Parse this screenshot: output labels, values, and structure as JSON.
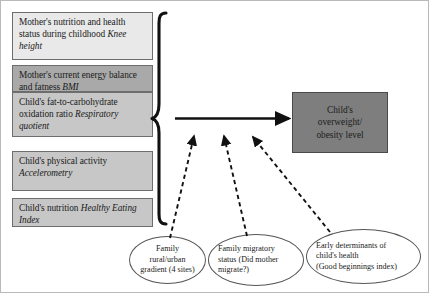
{
  "diagram": {
    "predictor_boxes": [
      {
        "id": "mother-nutrition",
        "text_plain": "Mother's nutrition and health status during childhood ",
        "measure_italic": "Knee height",
        "fill": "#e9e9e9"
      },
      {
        "id": "mother-energy",
        "text_plain": "Mother's current energy balance and fatness ",
        "measure_italic": "BMI",
        "fill": "#a9a9a9"
      },
      {
        "id": "child-fat-carb",
        "text_plain": "Child's fat-to-carbohydrate oxidation ratio ",
        "measure_italic": "Respiratory quotient",
        "fill": "#c7c7c7"
      },
      {
        "id": "child-activity",
        "text_plain": "Child's physical activity ",
        "measure_italic": "Accelerometry",
        "fill": "#c7c7c7"
      },
      {
        "id": "child-nutrition",
        "text_plain": "Child's nutrition ",
        "measure_italic": "Healthy Eating Index",
        "fill": "#c7c7c7"
      }
    ],
    "outcome_box": {
      "id": "outcome",
      "line1": "Child's",
      "line2": "overweight/",
      "line3": "obesity level",
      "fill": "#7e7e7e"
    },
    "context_ellipses": [
      {
        "id": "rural-urban",
        "line1": "Family",
        "line2": "rural/urban",
        "line3": "gradient (4 sites)"
      },
      {
        "id": "migratory",
        "line1": "Family migratory",
        "line2": "status (Did mother",
        "line3": "migrate?)"
      },
      {
        "id": "early-determinants",
        "line1": "Early determinants of",
        "line2": "child's health",
        "line3": "(Good beginnings index)"
      }
    ],
    "connectors": {
      "main_arrow_label": "solid arrow from predictor brace to outcome",
      "moderator_arrow_label": "dashed arrow from context ellipse to main pathway",
      "brace_label": "curly brace grouping predictor boxes",
      "line_color": "#111111"
    }
  }
}
